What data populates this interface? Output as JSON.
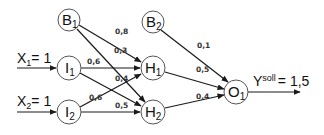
{
  "diagram": {
    "type": "neural-network",
    "colors": {
      "stroke": "#1a1a1a",
      "node_border": "#555555",
      "background": "#ffffff",
      "text": "#111111"
    },
    "nodes": [
      {
        "id": "B1",
        "base": "B",
        "sub": "1",
        "role": "bias",
        "cx": 69,
        "cy": 20
      },
      {
        "id": "B2",
        "base": "B",
        "sub": "2",
        "role": "bias",
        "cx": 153,
        "cy": 22
      },
      {
        "id": "I1",
        "base": "I",
        "sub": "1",
        "role": "input",
        "cx": 69,
        "cy": 68
      },
      {
        "id": "I2",
        "base": "I",
        "sub": "2",
        "role": "input",
        "cx": 69,
        "cy": 112
      },
      {
        "id": "H1",
        "base": "H",
        "sub": "1",
        "role": "hidden",
        "cx": 153,
        "cy": 68
      },
      {
        "id": "H2",
        "base": "H",
        "sub": "2",
        "role": "hidden",
        "cx": 153,
        "cy": 112
      },
      {
        "id": "O1",
        "base": "O",
        "sub": "1",
        "role": "output",
        "cx": 236,
        "cy": 92
      }
    ],
    "edges": [
      {
        "from": "B1",
        "to": "H1",
        "weight": "0,8"
      },
      {
        "from": "B1",
        "to": "H2",
        "weight": "0,3"
      },
      {
        "from": "I1",
        "to": "H1",
        "weight": "0,6"
      },
      {
        "from": "I1",
        "to": "H2",
        "weight": "0,4"
      },
      {
        "from": "I2",
        "to": "H1",
        "weight": "0,6"
      },
      {
        "from": "I2",
        "to": "H2",
        "weight": "0,5"
      },
      {
        "from": "B2",
        "to": "O1",
        "weight": "0,1"
      },
      {
        "from": "H1",
        "to": "O1",
        "weight": "0,5"
      },
      {
        "from": "H2",
        "to": "O1",
        "weight": "0,4"
      }
    ],
    "inputs": [
      {
        "base": "X",
        "sub": "1",
        "value": "= 1",
        "target": "I1"
      },
      {
        "base": "X",
        "sub": "2",
        "value": "= 1",
        "target": "I2"
      }
    ],
    "output": {
      "base": "Y",
      "sup": "soll",
      "value": "= 1,5",
      "source": "O1"
    }
  }
}
